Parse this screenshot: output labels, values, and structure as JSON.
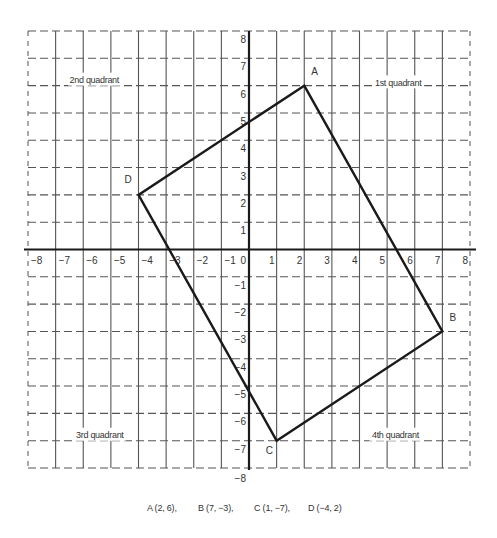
{
  "chart_data": {
    "type": "scatter",
    "title": "",
    "xlabel": "",
    "ylabel": "",
    "xlim": [
      -8,
      8
    ],
    "ylim": [
      -8,
      8
    ],
    "grid": true,
    "grid_style": {
      "vertical": "solid",
      "horizontal": "dashed",
      "border": "dashed"
    },
    "x_ticks": [
      "−8",
      "−7",
      "−6",
      "−5",
      "−4",
      "−3",
      "−2",
      "−1",
      "0",
      "1",
      "2",
      "3",
      "4",
      "5",
      "6",
      "7",
      "8"
    ],
    "y_ticks": [
      "8",
      "7",
      "6",
      "5",
      "4",
      "3",
      "2",
      "1",
      "−1",
      "−2",
      "−3",
      "−4",
      "−5",
      "−6",
      "−7",
      "−8"
    ],
    "polygon": {
      "name": "ABCD",
      "closed": true,
      "vertices": [
        {
          "label": "A",
          "x": 2,
          "y": 6
        },
        {
          "label": "B",
          "x": 7,
          "y": -3
        },
        {
          "label": "C",
          "x": 1,
          "y": -7
        },
        {
          "label": "D",
          "x": -4,
          "y": 2
        }
      ]
    },
    "quadrant_labels": [
      {
        "text": "2nd quadrant",
        "x": -5.6,
        "y": 6.2
      },
      {
        "text": "1st quadrant",
        "x": 5.4,
        "y": 6.1
      },
      {
        "text": "3rd quadrant",
        "x": -5.4,
        "y": -6.8
      },
      {
        "text": "4th quadrant",
        "x": 5.3,
        "y": -6.8
      }
    ]
  },
  "caption": {
    "items": [
      "A (2, 6),",
      "B (7, −3),",
      "C (1, −7),",
      "D (−4, 2)"
    ]
  },
  "colors": {
    "grid": "#555555",
    "axis": "#1a1a1a",
    "polygon": "#1a1a1a",
    "text": "#333333",
    "background": "#ffffff"
  }
}
